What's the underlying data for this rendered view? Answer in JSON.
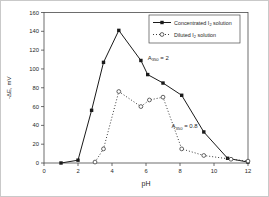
{
  "figure": {
    "background": "#ffffff",
    "frame_color": "#4a4a4a",
    "text_color": "#1f1f1f"
  },
  "chart_data": {
    "type": "line",
    "title": "",
    "xlabel": "pH",
    "ylabel": "-ΔE, mV",
    "xlim": [
      0,
      12
    ],
    "ylim": [
      0,
      160
    ],
    "xticks": [
      0,
      2,
      4,
      6,
      8,
      10,
      12
    ],
    "yticks": [
      0,
      20,
      40,
      60,
      80,
      100,
      120,
      140,
      160
    ],
    "grid": false,
    "legend_position": "top-right",
    "series": [
      {
        "name_pre": "Concentrated I",
        "name_sub": "2",
        "name_post": " solution",
        "marker": "filled-square",
        "line": "solid",
        "color": "#1a1a1a",
        "points": [
          [
            1,
            0
          ],
          [
            2,
            3
          ],
          [
            2.8,
            56
          ],
          [
            3.5,
            107
          ],
          [
            4.4,
            141
          ],
          [
            5.7,
            109
          ],
          [
            6.1,
            94
          ],
          [
            7,
            85
          ],
          [
            8.1,
            72
          ],
          [
            9.4,
            33
          ],
          [
            10.8,
            5
          ],
          [
            12,
            1
          ]
        ]
      },
      {
        "name_pre": "Diluted I",
        "name_sub": "2",
        "name_post": " solution",
        "marker": "open-circle",
        "line": "dotted",
        "color": "#3c3c3c",
        "points": [
          [
            3,
            1
          ],
          [
            3.5,
            15
          ],
          [
            4.4,
            76
          ],
          [
            5.7,
            60
          ],
          [
            6.2,
            67
          ],
          [
            7,
            70
          ],
          [
            8.1,
            15
          ],
          [
            9.4,
            8
          ],
          [
            11,
            4
          ],
          [
            12,
            2
          ]
        ]
      }
    ],
    "annotations": [
      {
        "pre": "A",
        "sub": "350",
        "post": " = 2",
        "x": 6.1,
        "y": 110
      },
      {
        "pre": "A",
        "sub": "350",
        "post": " = 0.8",
        "x": 7.5,
        "y": 37
      }
    ]
  }
}
